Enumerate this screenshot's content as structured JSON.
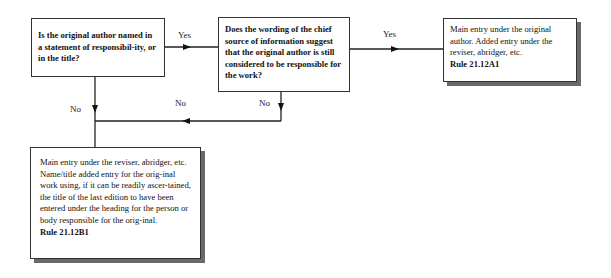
{
  "diagram": {
    "type": "flowchart",
    "nodes": {
      "q1": {
        "text": "Is the original author named in a statement of responsibil-ity, or in the title?"
      },
      "q2": {
        "text": "Does the wording of the chief source of information suggest that the original author is still considered to be responsible for the work?"
      },
      "r1": {
        "text": "Main entry under the original author. Added entry under the reviser, abridger, etc.",
        "rule": "Rule 21.12A1"
      },
      "r2": {
        "text": "Main entry under the reviser, abridger, etc. Name/title added entry for the orig-inal work using, if it can be readily ascer-tained, the title of the last edition to have been entered under the heading for the person or body responsible for the orig-inal.",
        "rule": "Rule 21.12B1"
      }
    },
    "edges": {
      "q1_yes": {
        "label": "Yes",
        "from": "q1",
        "to": "q2"
      },
      "q2_yes": {
        "label": "Yes",
        "from": "q2",
        "to": "r1"
      },
      "q1_no": {
        "label": "No",
        "from": "q1",
        "to": "r2"
      },
      "q2_no": {
        "label": "No",
        "from": "q2",
        "to": "r2"
      },
      "q2_no_merge": {
        "label": "No"
      }
    }
  },
  "colors": {
    "line": "#222222",
    "border": "#333333",
    "shadow": "#6a6a6a"
  }
}
